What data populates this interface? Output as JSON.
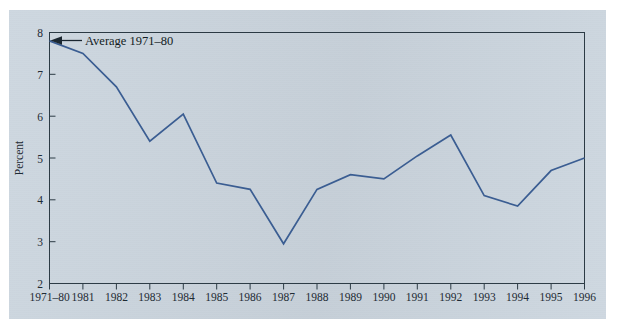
{
  "figure": {
    "panel_color": "#ccd6df",
    "page_color": "#ffffff"
  },
  "chart_data": {
    "type": "line",
    "title": "",
    "xlabel": "",
    "ylabel": "Percent",
    "categories": [
      "1971–80",
      "1981",
      "1982",
      "1983",
      "1984",
      "1985",
      "1986",
      "1987",
      "1988",
      "1989",
      "1990",
      "1991",
      "1992",
      "1993",
      "1994",
      "1995",
      "1996"
    ],
    "values": [
      7.8,
      7.5,
      6.7,
      5.4,
      6.05,
      4.4,
      4.25,
      2.95,
      4.25,
      4.6,
      4.5,
      5.05,
      5.55,
      4.1,
      3.85,
      4.7,
      5.0
    ],
    "ylim": [
      2,
      8
    ],
    "yticks": [
      2,
      3,
      4,
      5,
      6,
      7,
      8
    ],
    "ytick_labels": [
      "2",
      "3",
      "4",
      "5",
      "6",
      "7",
      "8"
    ],
    "grid": false,
    "legend": null,
    "series_color": "#3a5d92",
    "annotations": [
      {
        "text": "Average 1971–80",
        "target_category": "1971–80",
        "target_value": 7.8,
        "arrow": "left"
      }
    ]
  }
}
